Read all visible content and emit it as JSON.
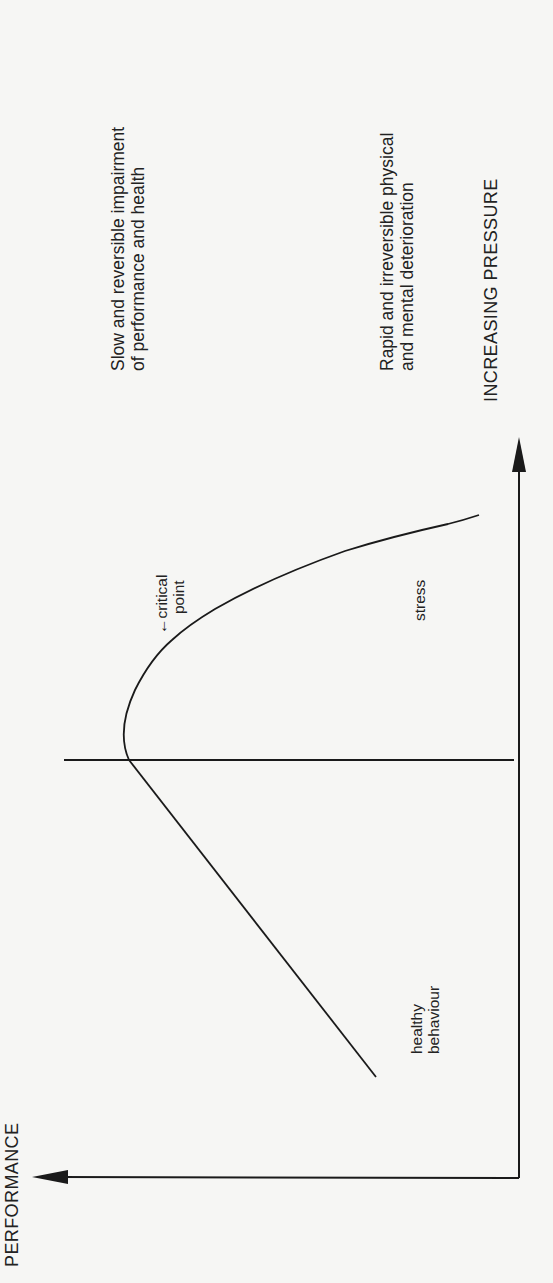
{
  "diagram": {
    "type": "performance-pressure curve (rotated 90 degrees)",
    "axes": {
      "x_label": "INCREASING PRESSURE",
      "y_label": "PERFORMANCE"
    },
    "region_labels": {
      "slow_reversible": {
        "line1": "Slow and reversible impairment",
        "line2": "of performance and health"
      },
      "rapid_irreversible": {
        "line1": "Rapid and irreversible physical",
        "line2": "and mental deterioration"
      }
    },
    "curve_labels": {
      "critical_point": {
        "line1": "←critical",
        "line2": "point"
      },
      "stress": "stress",
      "healthy": {
        "line1": "healthy",
        "line2": "behaviour"
      }
    },
    "colors": {
      "background": "#f6f6f4",
      "ink": "#1a1a1a"
    }
  }
}
